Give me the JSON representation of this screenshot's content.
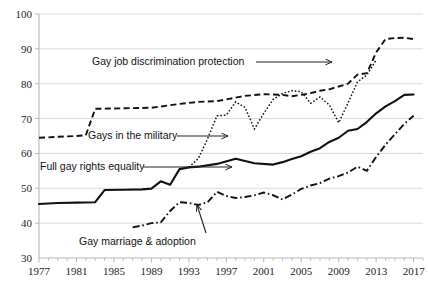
{
  "chart_data": {
    "type": "line",
    "title": "",
    "xlabel": "",
    "ylabel": "",
    "xlim": [
      1977,
      2018
    ],
    "ylim": [
      30,
      100
    ],
    "grid": true,
    "legend_position": "inline-annotations",
    "y_ticks": [
      "30",
      "40",
      "50",
      "60",
      "70",
      "80",
      "90",
      "100"
    ],
    "x_ticks": [
      "1977",
      "1981",
      "1985",
      "1989",
      "1993",
      "1997",
      "2001",
      "2005",
      "2009",
      "2013",
      "2017"
    ],
    "x_tick_years": [
      1977,
      1981,
      1985,
      1989,
      1993,
      1997,
      2001,
      2005,
      2009,
      2013,
      2017
    ],
    "x_minor_years": [
      1977,
      1978,
      1979,
      1980,
      1981,
      1982,
      1983,
      1984,
      1985,
      1986,
      1987,
      1988,
      1989,
      1990,
      1991,
      1992,
      1993,
      1994,
      1995,
      1996,
      1997,
      1998,
      1999,
      2000,
      2001,
      2002,
      2003,
      2004,
      2005,
      2006,
      2007,
      2008,
      2009,
      2010,
      2011,
      2012,
      2013,
      2014,
      2015,
      2016,
      2017,
      2018
    ],
    "series": [
      {
        "name": "Gay job discrimination protection",
        "style": "dashed",
        "color": "#111111",
        "x": [
          1977,
          1978,
          1979,
          1980,
          1981,
          1982,
          1983,
          1985,
          1987,
          1989,
          1992,
          1993,
          1994,
          1996,
          1999,
          2001,
          2003,
          2004,
          2005,
          2006,
          2007,
          2008,
          2009,
          2010,
          2011,
          2012,
          2013,
          2014,
          2015,
          2016,
          2017
        ],
        "values": [
          64.5,
          64.6,
          64.8,
          64.9,
          65.0,
          65.2,
          72.8,
          72.9,
          73.0,
          73.1,
          74.2,
          74.5,
          74.8,
          75.0,
          76.5,
          77.0,
          76.8,
          76.4,
          76.8,
          77.3,
          78.0,
          78.4,
          79.2,
          80.0,
          82.6,
          83.0,
          89.0,
          92.8,
          93.1,
          93.2,
          92.8
        ]
      },
      {
        "name": "Gays in the military",
        "style": "dotted",
        "color": "#111111",
        "x": [
          1993,
          1994,
          1995,
          1996,
          1997,
          1998,
          1999,
          2000,
          2001,
          2002,
          2003,
          2004,
          2005,
          2006,
          2007,
          2008,
          2009,
          2010,
          2011,
          2012,
          2013
        ],
        "values": [
          56.0,
          58.5,
          64.2,
          70.8,
          71.0,
          74.8,
          73.2,
          67.0,
          71.5,
          75.5,
          77.2,
          78.0,
          77.7,
          74.4,
          76.2,
          73.9,
          68.8,
          74.5,
          80.5,
          82.5,
          86.8
        ]
      },
      {
        "name": "Full gay rights equality",
        "style": "solid",
        "color": "#111111",
        "x": [
          1977,
          1979,
          1981,
          1983,
          1984,
          1986,
          1988,
          1989,
          1990,
          1991,
          1992,
          1993,
          1994,
          1996,
          1998,
          2000,
          2002,
          2003,
          2004,
          2005,
          2006,
          2007,
          2008,
          2009,
          2010,
          2011,
          2012,
          2013,
          2014,
          2015,
          2016,
          2017
        ],
        "values": [
          45.5,
          45.8,
          45.9,
          46.0,
          49.5,
          49.6,
          49.7,
          49.9,
          52.0,
          51.0,
          55.5,
          56.0,
          56.2,
          57.0,
          58.5,
          57.2,
          56.8,
          57.5,
          58.4,
          59.2,
          60.5,
          61.5,
          63.3,
          64.5,
          66.5,
          67.0,
          69.0,
          71.5,
          73.5,
          75.0,
          76.8,
          76.9
        ]
      },
      {
        "name": "Gay marriage & adoption",
        "style": "dashdot",
        "color": "#111111",
        "x": [
          1987,
          1988,
          1989,
          1990,
          1991,
          1992,
          1993,
          1994,
          1995,
          1996,
          1997,
          1998,
          1999,
          2000,
          2001,
          2002,
          2003,
          2004,
          2005,
          2006,
          2007,
          2008,
          2009,
          2010,
          2011,
          2012,
          2013,
          2014,
          2015,
          2016,
          2017
        ],
        "values": [
          38.8,
          39.3,
          40.0,
          40.2,
          43.5,
          46.0,
          45.8,
          45.2,
          46.0,
          49.0,
          47.8,
          47.2,
          47.5,
          48.0,
          48.8,
          48.0,
          46.8,
          48.2,
          49.8,
          50.8,
          51.5,
          52.8,
          53.5,
          54.5,
          56.2,
          55.0,
          59.0,
          62.5,
          65.5,
          68.5,
          70.8
        ]
      }
    ],
    "annotations": [
      {
        "id": "ann-job-discrimination",
        "text": "Gay job discrimination protection",
        "label_x": 92,
        "label_y": 56,
        "leader_from_x": 256,
        "leader_from_y": 62,
        "leader_to_x": 332,
        "leader_to_y": 62
      },
      {
        "id": "ann-military",
        "text": "Gays in the military",
        "label_x": 88,
        "label_y": 130,
        "leader_from_x": 177,
        "leader_from_y": 136,
        "leader_to_x": 228,
        "leader_to_y": 136
      },
      {
        "id": "ann-full-rights",
        "text": "Full gay rights equality",
        "label_x": 40,
        "label_y": 161,
        "leader_from_x": 143,
        "leader_from_y": 167,
        "leader_to_x": 232,
        "leader_to_y": 167
      },
      {
        "id": "ann-marriage",
        "text": "Gay marriage & adoption",
        "label_x": 79,
        "label_y": 236,
        "leader_from_x": 206,
        "leader_from_y": 233,
        "leader_to_x": 197,
        "leader_to_y": 205
      }
    ]
  }
}
